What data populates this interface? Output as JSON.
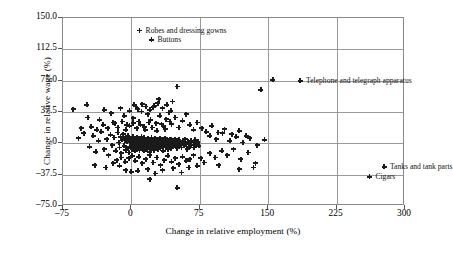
{
  "chart_data": {
    "type": "scatter",
    "title": "",
    "xlabel": "Change in relative employment (%)",
    "ylabel": "Change in relative wage (%)",
    "xlim": [
      -75,
      300
    ],
    "ylim": [
      -75.0,
      150.0
    ],
    "xticks": [
      "‒75",
      "0",
      "75",
      "150",
      "225",
      "300"
    ],
    "xtick_values": [
      -75,
      0,
      75,
      150,
      225,
      300
    ],
    "yticks": [
      "150.0",
      "112.5",
      "75.0",
      "37.5",
      "0",
      "‒37.5",
      "‒75.0"
    ],
    "ytick_values": [
      150.0,
      112.5,
      75.0,
      37.5,
      0,
      -37.5,
      -75.0
    ],
    "grid": true,
    "legend": "none",
    "marker": "plus",
    "marker_color": "#1a1a1a",
    "annotations": [
      {
        "label": "Robes and dressing gowns",
        "x": 9,
        "y": 135,
        "side": "left"
      },
      {
        "label": "Buttons",
        "x": 22,
        "y": 124,
        "side": "left"
      },
      {
        "label": "Telephone and telegraph apparatus",
        "x": 185,
        "y": 75,
        "side": "left"
      },
      {
        "label": "Tanks and tank parts",
        "x": 277,
        "y": -28,
        "side": "left"
      },
      {
        "label": "Cigars",
        "x": 261,
        "y": -40,
        "side": "left"
      }
    ],
    "points": [
      [
        9,
        135
      ],
      [
        22,
        124
      ],
      [
        185,
        75
      ],
      [
        277,
        -28
      ],
      [
        261,
        -40
      ],
      [
        155,
        76
      ],
      [
        142,
        64
      ],
      [
        50,
        68
      ],
      [
        30,
        53
      ],
      [
        45,
        50
      ],
      [
        -64,
        41
      ],
      [
        -49,
        46
      ],
      [
        -48,
        31
      ],
      [
        -35,
        28
      ],
      [
        -30,
        40
      ],
      [
        -22,
        36
      ],
      [
        -18,
        24
      ],
      [
        -12,
        42
      ],
      [
        -8,
        33
      ],
      [
        -5,
        22
      ],
      [
        -2,
        39
      ],
      [
        2,
        30
      ],
      [
        5,
        44
      ],
      [
        8,
        26
      ],
      [
        11,
        38
      ],
      [
        14,
        20
      ],
      [
        18,
        35
      ],
      [
        21,
        28
      ],
      [
        24,
        43
      ],
      [
        27,
        24
      ],
      [
        31,
        33
      ],
      [
        35,
        21
      ],
      [
        38,
        29
      ],
      [
        41,
        37
      ],
      [
        44,
        23
      ],
      [
        48,
        31
      ],
      [
        52,
        19
      ],
      [
        56,
        27
      ],
      [
        60,
        35
      ],
      [
        64,
        22
      ],
      [
        68,
        16
      ],
      [
        72,
        25
      ],
      [
        77,
        18
      ],
      [
        82,
        14
      ],
      [
        88,
        21
      ],
      [
        95,
        13
      ],
      [
        102,
        17
      ],
      [
        110,
        11
      ],
      [
        118,
        15
      ],
      [
        126,
        9
      ],
      [
        3,
        46
      ],
      [
        7,
        41
      ],
      [
        12,
        47
      ],
      [
        16,
        44
      ],
      [
        20,
        40
      ],
      [
        25,
        45
      ],
      [
        29,
        48
      ],
      [
        34,
        42
      ],
      [
        39,
        46
      ],
      [
        43,
        39
      ],
      [
        -58,
        6
      ],
      [
        -52,
        12
      ],
      [
        -46,
        -4
      ],
      [
        -42,
        9
      ],
      [
        -39,
        -10
      ],
      [
        -36,
        3
      ],
      [
        -33,
        14
      ],
      [
        -30,
        -7
      ],
      [
        -27,
        5
      ],
      [
        -25,
        -14
      ],
      [
        -23,
        10
      ],
      [
        -21,
        -2
      ],
      [
        -19,
        7
      ],
      [
        -17,
        -9
      ],
      [
        -15,
        13
      ],
      [
        -14,
        1
      ],
      [
        -13,
        -5
      ],
      [
        -12,
        8
      ],
      [
        -11,
        -12
      ],
      [
        -10,
        4
      ],
      [
        -9,
        11
      ],
      [
        -8,
        -3
      ],
      [
        -7,
        6
      ],
      [
        -6,
        -8
      ],
      [
        -5,
        2
      ],
      [
        -4,
        9
      ],
      [
        -4,
        -6
      ],
      [
        -3,
        5
      ],
      [
        -3,
        -11
      ],
      [
        -2,
        1
      ],
      [
        -2,
        7
      ],
      [
        -1,
        -4
      ],
      [
        -1,
        3
      ],
      [
        0,
        -2
      ],
      [
        0,
        6
      ],
      [
        0,
        0
      ],
      [
        1,
        -7
      ],
      [
        1,
        4
      ],
      [
        2,
        -1
      ],
      [
        2,
        8
      ],
      [
        3,
        -5
      ],
      [
        3,
        2
      ],
      [
        4,
        -9
      ],
      [
        4,
        5
      ],
      [
        5,
        -3
      ],
      [
        5,
        1
      ],
      [
        6,
        7
      ],
      [
        6,
        -6
      ],
      [
        7,
        3
      ],
      [
        7,
        -1
      ],
      [
        8,
        6
      ],
      [
        8,
        -4
      ],
      [
        9,
        2
      ],
      [
        9,
        -8
      ],
      [
        10,
        5
      ],
      [
        10,
        0
      ],
      [
        11,
        -3
      ],
      [
        11,
        8
      ],
      [
        12,
        2
      ],
      [
        12,
        -6
      ],
      [
        13,
        4
      ],
      [
        13,
        -1
      ],
      [
        14,
        7
      ],
      [
        14,
        -9
      ],
      [
        15,
        1
      ],
      [
        15,
        -4
      ],
      [
        16,
        5
      ],
      [
        16,
        0
      ],
      [
        17,
        -7
      ],
      [
        17,
        3
      ],
      [
        18,
        6
      ],
      [
        18,
        -2
      ],
      [
        19,
        1
      ],
      [
        19,
        -5
      ],
      [
        20,
        4
      ],
      [
        20,
        -10
      ],
      [
        21,
        2
      ],
      [
        21,
        -1
      ],
      [
        22,
        7
      ],
      [
        22,
        -6
      ],
      [
        23,
        3
      ],
      [
        23,
        0
      ],
      [
        24,
        -4
      ],
      [
        24,
        5
      ],
      [
        25,
        1
      ],
      [
        25,
        -8
      ],
      [
        26,
        6
      ],
      [
        26,
        -2
      ],
      [
        27,
        2
      ],
      [
        27,
        -5
      ],
      [
        28,
        4
      ],
      [
        28,
        0
      ],
      [
        29,
        -7
      ],
      [
        29,
        3
      ],
      [
        30,
        1
      ],
      [
        30,
        -3
      ],
      [
        31,
        6
      ],
      [
        31,
        -1
      ],
      [
        32,
        4
      ],
      [
        32,
        -6
      ],
      [
        33,
        2
      ],
      [
        33,
        0
      ],
      [
        34,
        -4
      ],
      [
        34,
        5
      ],
      [
        35,
        1
      ],
      [
        35,
        -9
      ],
      [
        36,
        3
      ],
      [
        36,
        -2
      ],
      [
        37,
        6
      ],
      [
        37,
        0
      ],
      [
        38,
        -5
      ],
      [
        38,
        2
      ],
      [
        39,
        4
      ],
      [
        39,
        -1
      ],
      [
        40,
        -7
      ],
      [
        40,
        3
      ],
      [
        41,
        1
      ],
      [
        41,
        -3
      ],
      [
        42,
        5
      ],
      [
        42,
        -2
      ],
      [
        43,
        0
      ],
      [
        43,
        -6
      ],
      [
        44,
        2
      ],
      [
        44,
        4
      ],
      [
        45,
        -1
      ],
      [
        46,
        -4
      ],
      [
        46,
        3
      ],
      [
        47,
        1
      ],
      [
        48,
        -2
      ],
      [
        48,
        5
      ],
      [
        49,
        0
      ],
      [
        50,
        -6
      ],
      [
        50,
        2
      ],
      [
        51,
        -1
      ],
      [
        52,
        4
      ],
      [
        53,
        -3
      ],
      [
        54,
        1
      ],
      [
        55,
        -5
      ],
      [
        56,
        3
      ],
      [
        57,
        0
      ],
      [
        58,
        -2
      ],
      [
        59,
        5
      ],
      [
        60,
        -1
      ],
      [
        61,
        -7
      ],
      [
        62,
        2
      ],
      [
        63,
        0
      ],
      [
        64,
        -4
      ],
      [
        65,
        3
      ],
      [
        66,
        -2
      ],
      [
        68,
        1
      ],
      [
        69,
        -5
      ],
      [
        70,
        4
      ],
      [
        71,
        -1
      ],
      [
        73,
        2
      ],
      [
        74,
        -3
      ],
      [
        -16,
        -20
      ],
      [
        -11,
        -17
      ],
      [
        -7,
        -22
      ],
      [
        -3,
        -18
      ],
      [
        1,
        -15
      ],
      [
        4,
        -21
      ],
      [
        8,
        -16
      ],
      [
        12,
        -24
      ],
      [
        16,
        -19
      ],
      [
        20,
        -14
      ],
      [
        24,
        -23
      ],
      [
        28,
        -17
      ],
      [
        32,
        -26
      ],
      [
        36,
        -20
      ],
      [
        40,
        -15
      ],
      [
        44,
        -22
      ],
      [
        48,
        -18
      ],
      [
        52,
        -25
      ],
      [
        56,
        -16
      ],
      [
        60,
        -21
      ],
      [
        64,
        -19
      ],
      [
        68,
        -14
      ],
      [
        72,
        -27
      ],
      [
        76,
        -18
      ],
      [
        80,
        -23
      ],
      [
        0,
        -34
      ],
      [
        7,
        -33
      ],
      [
        18,
        -31
      ],
      [
        26,
        -36
      ],
      [
        34,
        -32
      ],
      [
        46,
        -30
      ],
      [
        55,
        -35
      ],
      [
        63,
        -29
      ],
      [
        20,
        -43
      ],
      [
        50,
        -53
      ],
      [
        86,
        -12
      ],
      [
        92,
        -17
      ],
      [
        99,
        -9
      ],
      [
        105,
        -14
      ],
      [
        112,
        -7
      ],
      [
        120,
        -19
      ],
      [
        128,
        -11
      ],
      [
        136,
        -24
      ],
      [
        86,
        9
      ],
      [
        93,
        5
      ],
      [
        100,
        12
      ],
      [
        108,
        3
      ],
      [
        115,
        8
      ],
      [
        122,
        1
      ],
      [
        130,
        6
      ],
      [
        138,
        -2
      ],
      [
        146,
        4
      ],
      [
        96,
        -26
      ],
      [
        118,
        -31
      ],
      [
        134,
        -29
      ],
      [
        -55,
        18
      ],
      [
        -44,
        20
      ],
      [
        -38,
        16
      ],
      [
        -31,
        22
      ],
      [
        -26,
        18
      ],
      [
        -20,
        25
      ],
      [
        -15,
        19
      ],
      [
        -10,
        26
      ],
      [
        -6,
        16
      ],
      [
        -2,
        21
      ],
      [
        2,
        24
      ],
      [
        6,
        18
      ],
      [
        10,
        22
      ],
      [
        15,
        16
      ],
      [
        19,
        25
      ],
      [
        23,
        19
      ],
      [
        28,
        15
      ],
      [
        33,
        23
      ],
      [
        37,
        17
      ],
      [
        42,
        26
      ],
      [
        -40,
        -26
      ],
      [
        -28,
        -29
      ],
      [
        -20,
        -24
      ],
      [
        -13,
        -27
      ],
      [
        -6,
        -32
      ]
    ]
  }
}
